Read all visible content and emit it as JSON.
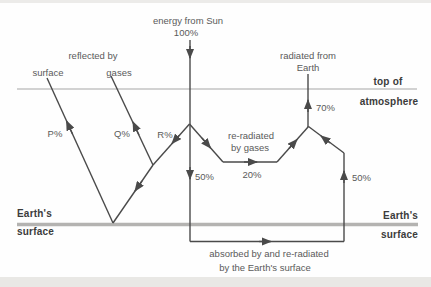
{
  "colors": {
    "background": "#fefefe",
    "flow_line": "#4a4a4a",
    "atmosphere_line": "#a6a6a6",
    "surface_line": "#b4b3b1",
    "label_text": "#5a5a5a",
    "bold_label_text": "#3b3b3b",
    "page_edge_strip": "#e9e8e5"
  },
  "sun": {
    "label": "energy from Sun",
    "percent": "100%"
  },
  "reflection": {
    "heading": "reflected by",
    "surface": "surface",
    "gases": "gases",
    "p": "P%",
    "q": "Q%",
    "r": "R%"
  },
  "atmosphere_boundary": {
    "line1": "top of",
    "line2": "atmosphere"
  },
  "radiated": {
    "line1": "radiated from",
    "line2": "Earth",
    "percent": "70%"
  },
  "transmission": {
    "down_to_surface": "50%",
    "re_radiated_line1": "re-radiated",
    "re_radiated_line2": "by gases",
    "gases_percent": "20%",
    "up_from_surface": "50%"
  },
  "surface": {
    "left_line1": "Earth's",
    "left_line2": "surface",
    "right_line1": "Earth's",
    "right_line2": "surface",
    "absorbed_line1": "absorbed by and re-radiated",
    "absorbed_line2": "by the Earth's surface"
  }
}
